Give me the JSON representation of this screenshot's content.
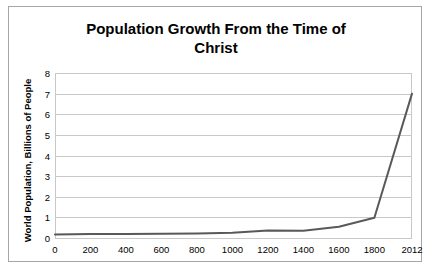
{
  "chart_data": {
    "type": "line",
    "title": "Population Growth From the Time of Christ",
    "title_line1": "Population Growth From the Time of",
    "title_line2": "Christ",
    "xlabel": "",
    "ylabel": "World Population, Billions of People",
    "xlim": [
      0,
      2012
    ],
    "ylim": [
      0,
      8
    ],
    "grid": true,
    "legend": "none",
    "line_color": "#595959",
    "gridline_color": "#c8c8c8",
    "border_color": "#a6a6a6",
    "x_tick_labels": [
      "0",
      "200",
      "400",
      "600",
      "800",
      "1000",
      "1200",
      "1400",
      "1600",
      "1800",
      "2012"
    ],
    "x_tick_values": [
      0,
      200,
      400,
      600,
      800,
      1000,
      1200,
      1400,
      1600,
      1800,
      2012
    ],
    "y_tick_labels": [
      "0",
      "1",
      "2",
      "3",
      "4",
      "5",
      "6",
      "7",
      "8"
    ],
    "y_tick_values": [
      0,
      1,
      2,
      3,
      4,
      5,
      6,
      7,
      8
    ],
    "series": [
      {
        "name": "World Population",
        "x": [
          0,
          200,
          400,
          600,
          800,
          1000,
          1200,
          1400,
          1600,
          1800,
          2012
        ],
        "values": [
          0.17,
          0.19,
          0.2,
          0.21,
          0.22,
          0.26,
          0.36,
          0.35,
          0.55,
          0.98,
          7.0
        ]
      }
    ]
  }
}
